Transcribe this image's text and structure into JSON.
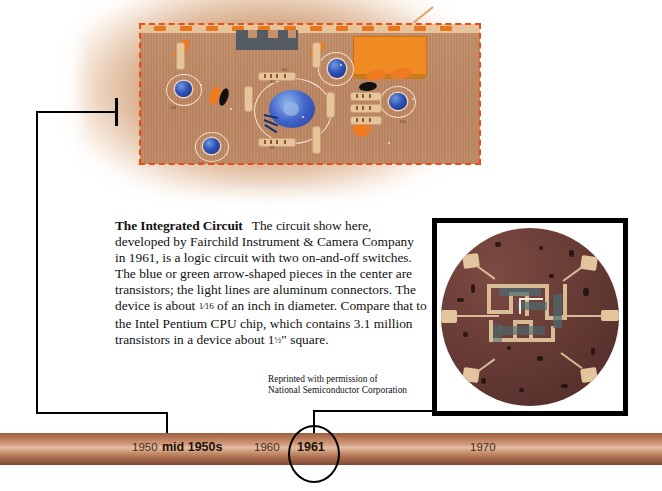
{
  "page": {
    "title": "The Integrated Circuit"
  },
  "circuit_panel": {
    "name": "printed-circuit-board-illustration",
    "dashed_border_color": "#f04b13",
    "board_color": "#c5906c",
    "component_labels": [
      "R17",
      "R10",
      "R12",
      "C18",
      "C13",
      "R8",
      "R6",
      "R11",
      "R14",
      "R15",
      "C1",
      "D4"
    ]
  },
  "caption": {
    "heading": "The Integrated Circuit",
    "body_part1": "The circuit show here, developed by Fairchild Instrument & Camera Company in 1961, is a logic circuit with two on-and-off switches. The blue or green arrow-shaped pieces in the center are transistors; the light lines are aluminum connectors. The device is about ",
    "fraction": "1⁄16",
    "body_part2": " of an inch in diameter. Compare that to the Intel Pentium CPU chip, which contains 3.1 million transistors in a device about 1",
    "fraction2": "½",
    "body_part3": "″ square."
  },
  "photo": {
    "alt_name": "integrated-circuit-die-photograph",
    "credit_line_1": "Reprinted with permission of",
    "credit_line_2": "National Semiconductor Corporation"
  },
  "timeline": {
    "bar_color": "#c78f6c",
    "ticks": [
      {
        "label": "1950",
        "bold": false,
        "x": 132
      },
      {
        "label": "mid 1950s",
        "bold": true,
        "x": 162
      },
      {
        "label": "1960",
        "bold": false,
        "x": 254
      },
      {
        "label": "1961",
        "bold": true,
        "x": 297
      },
      {
        "label": "1970",
        "bold": false,
        "x": 470
      }
    ],
    "highlighted_year": "1961"
  }
}
